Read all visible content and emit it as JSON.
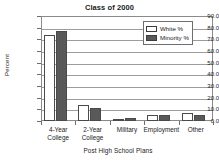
{
  "chart_data": {
    "type": "bar",
    "title": "Class of 2000",
    "xlabel": "Post High School Plans",
    "ylabel": "Percent",
    "categories": [
      "4-Year College",
      "2-Year College",
      "Military",
      "Employment",
      "Other"
    ],
    "category_lines": [
      [
        "4-Year",
        "College"
      ],
      [
        "2-Year",
        "College"
      ],
      [
        "Military",
        ""
      ],
      [
        "Employment",
        ""
      ],
      [
        "Other",
        ""
      ]
    ],
    "series": [
      {
        "name": "White %",
        "color": "#ffffff",
        "values": [
          73.5,
          14.0,
          2.0,
          5.0,
          6.5
        ]
      },
      {
        "name": "Minority %",
        "color": "#595959",
        "values": [
          77.5,
          11.0,
          3.0,
          5.0,
          5.5
        ]
      }
    ],
    "ylim": [
      0.0,
      90.0
    ],
    "ytick_values": [
      0.0,
      10.0,
      20.0,
      30.0,
      40.0,
      50.0,
      60.0,
      70.0,
      80.0,
      90.0
    ],
    "ytick_labels": [
      "0.0",
      "10.0",
      "20.0",
      "30.0",
      "40.0",
      "50.0",
      "60.0",
      "70.0",
      "80.0",
      "90.0"
    ],
    "grid": true,
    "legend_position": "top-right",
    "legend_entries": [
      "White %",
      "Minority %"
    ]
  }
}
